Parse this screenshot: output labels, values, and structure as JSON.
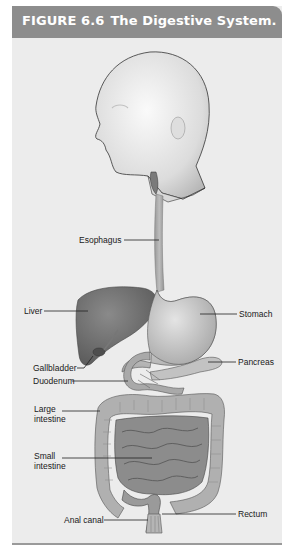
{
  "figure": {
    "number": "FIGURE 6.6",
    "title": "The Digestive System."
  },
  "labels": {
    "esophagus": "Esophagus",
    "liver": "Liver",
    "stomach": "Stomach",
    "pancreas": "Pancreas",
    "gallbladder": "Gallbladder",
    "duodenum": "Duodenum",
    "large_intestine_1": "Large",
    "large_intestine_2": "intestine",
    "small_intestine_1": "Small",
    "small_intestine_2": "intestine",
    "anal_canal": "Anal canal",
    "rectum": "Rectum"
  },
  "colors": {
    "header_bg": "#8d8d8d",
    "panel_bg": "#ececec",
    "organ": "#a8a8a8",
    "liver": "#6e6e6e"
  }
}
